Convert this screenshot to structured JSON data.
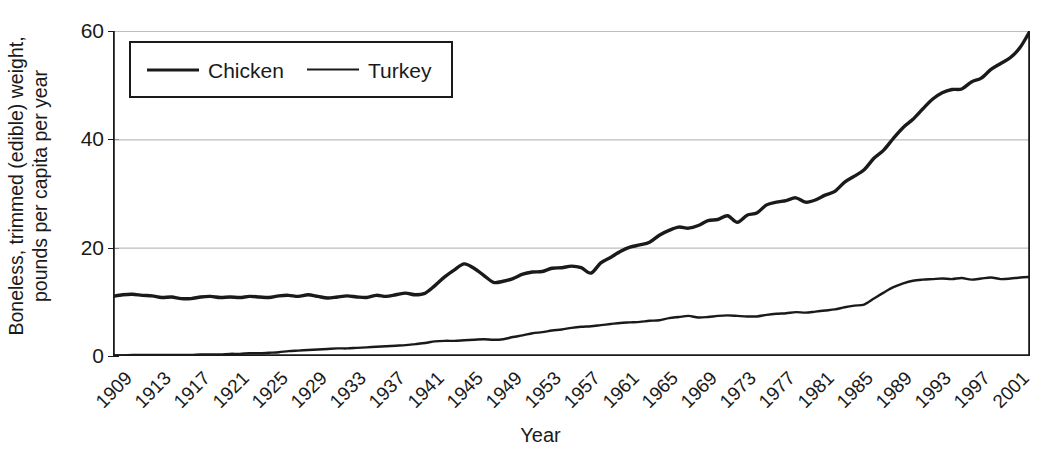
{
  "chart_data": {
    "type": "line",
    "title": "",
    "xlabel": "Year",
    "ylabel": "Boneless, trimmed (edible) weight, pounds per capita per year",
    "ylabel_line1": "Boneless, trimmed (edible) weight,",
    "ylabel_line2": "pounds per capita per year",
    "ylim": [
      0,
      60
    ],
    "yticks": [
      0,
      20,
      40,
      60
    ],
    "ytick_labels": [
      "0",
      "20",
      "40",
      "60"
    ],
    "xlim": [
      1909,
      2003
    ],
    "xticks": [
      1909,
      1913,
      1917,
      1921,
      1925,
      1929,
      1933,
      1937,
      1941,
      1945,
      1949,
      1953,
      1957,
      1961,
      1965,
      1969,
      1973,
      1977,
      1981,
      1985,
      1989,
      1993,
      1997,
      2001
    ],
    "xtick_labels": [
      "1909",
      "1913",
      "1917",
      "1921",
      "1925",
      "1929",
      "1933",
      "1937",
      "1941",
      "1945",
      "1949",
      "1953",
      "1957",
      "1961",
      "1965",
      "1969",
      "1973",
      "1977",
      "1981",
      "1985",
      "1989",
      "1993",
      "1997",
      "2001"
    ],
    "grid": "horizontal",
    "legend_position": "top-left-inside",
    "legend": [
      "Chicken",
      "Turkey"
    ],
    "line_color": "#1a1a1a",
    "grid_color": "#bdbdbd",
    "axis_color": "#1a1a1a",
    "x": [
      1909,
      1910,
      1911,
      1912,
      1913,
      1914,
      1915,
      1916,
      1917,
      1918,
      1919,
      1920,
      1921,
      1922,
      1923,
      1924,
      1925,
      1926,
      1927,
      1928,
      1929,
      1930,
      1931,
      1932,
      1933,
      1934,
      1935,
      1936,
      1937,
      1938,
      1939,
      1940,
      1941,
      1942,
      1943,
      1944,
      1945,
      1946,
      1947,
      1948,
      1949,
      1950,
      1951,
      1952,
      1953,
      1954,
      1955,
      1956,
      1957,
      1958,
      1959,
      1960,
      1961,
      1962,
      1963,
      1964,
      1965,
      1966,
      1967,
      1968,
      1969,
      1970,
      1971,
      1972,
      1973,
      1974,
      1975,
      1976,
      1977,
      1978,
      1979,
      1980,
      1981,
      1982,
      1983,
      1984,
      1985,
      1986,
      1987,
      1988,
      1989,
      1990,
      1991,
      1992,
      1993,
      1994,
      1995,
      1996,
      1997,
      1998,
      1999,
      2000,
      2001,
      2002,
      2003
    ],
    "series": [
      {
        "name": "Chicken",
        "values": [
          11.0,
          11.3,
          11.4,
          11.2,
          11.1,
          10.8,
          10.9,
          10.6,
          10.6,
          10.9,
          11.0,
          10.8,
          10.9,
          10.8,
          11.0,
          10.9,
          10.8,
          11.1,
          11.2,
          11.0,
          11.3,
          11.0,
          10.7,
          10.9,
          11.1,
          10.9,
          10.8,
          11.2,
          11.0,
          11.3,
          11.6,
          11.3,
          11.6,
          13.0,
          14.6,
          15.9,
          17.0,
          16.2,
          14.9,
          13.6,
          13.8,
          14.3,
          15.1,
          15.5,
          15.6,
          16.2,
          16.3,
          16.6,
          16.3,
          15.3,
          17.2,
          18.2,
          19.3,
          20.1,
          20.5,
          21.0,
          22.3,
          23.2,
          23.8,
          23.6,
          24.1,
          25.0,
          25.2,
          25.9,
          24.7,
          26.0,
          26.4,
          27.9,
          28.4,
          28.7,
          29.2,
          28.4,
          28.8,
          29.7,
          30.4,
          32.1,
          33.2,
          34.4,
          36.5,
          38.0,
          40.2,
          42.2,
          43.7,
          45.6,
          47.4,
          48.6,
          49.2,
          49.3,
          50.6,
          51.3,
          52.9,
          54.0,
          55.1,
          57.0,
          60.0
        ]
      },
      {
        "name": "Turkey",
        "values": [
          0.1,
          0.1,
          0.2,
          0.2,
          0.2,
          0.2,
          0.2,
          0.2,
          0.2,
          0.3,
          0.3,
          0.3,
          0.4,
          0.4,
          0.5,
          0.5,
          0.6,
          0.7,
          0.9,
          1.0,
          1.1,
          1.2,
          1.3,
          1.4,
          1.4,
          1.5,
          1.6,
          1.7,
          1.8,
          1.9,
          2.0,
          2.2,
          2.4,
          2.7,
          2.8,
          2.8,
          2.9,
          3.0,
          3.1,
          3.0,
          3.1,
          3.5,
          3.8,
          4.2,
          4.4,
          4.7,
          4.9,
          5.2,
          5.4,
          5.5,
          5.7,
          5.9,
          6.1,
          6.2,
          6.3,
          6.5,
          6.6,
          7.0,
          7.2,
          7.4,
          7.1,
          7.2,
          7.4,
          7.5,
          7.4,
          7.3,
          7.3,
          7.6,
          7.8,
          7.9,
          8.1,
          8.0,
          8.2,
          8.4,
          8.6,
          9.0,
          9.3,
          9.5,
          10.6,
          11.7,
          12.7,
          13.4,
          13.9,
          14.1,
          14.2,
          14.3,
          14.2,
          14.4,
          14.1,
          14.3,
          14.5,
          14.2,
          14.3,
          14.5,
          14.6
        ]
      }
    ]
  }
}
